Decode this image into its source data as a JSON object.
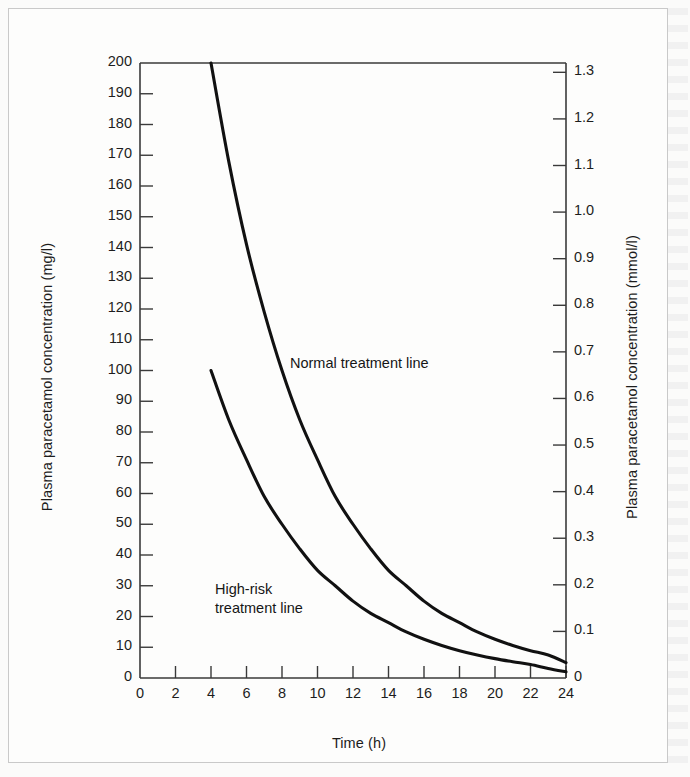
{
  "figure": {
    "background_color": "#fdfdfc",
    "frame_color": "#c9c9c9",
    "curve_color": "#111111",
    "axis_color": "#3a3a3a"
  },
  "chart_data": {
    "type": "line",
    "title": "",
    "xlabel": "Time (h)",
    "ylabel": "Plasma paracetamol concentration (mg/l)",
    "ylabel_right": "Plasma paracetamol concentration (mmol/l)",
    "xlim": [
      0,
      24
    ],
    "ylim": [
      0,
      200
    ],
    "ylim_right": [
      0,
      1.32
    ],
    "grid": false,
    "legend": "inline annotations",
    "xticks": [
      0,
      2,
      4,
      6,
      8,
      10,
      12,
      14,
      16,
      18,
      20,
      22,
      24
    ],
    "xtick_labels": [
      "0",
      "2",
      "4",
      "6",
      "8",
      "10",
      "12",
      "14",
      "16",
      "18",
      "20",
      "22",
      "24"
    ],
    "yticks": [
      0,
      10,
      20,
      30,
      40,
      50,
      60,
      70,
      80,
      90,
      100,
      110,
      120,
      130,
      140,
      150,
      160,
      170,
      180,
      190,
      200
    ],
    "ytick_labels": [
      "0",
      "10",
      "20",
      "30",
      "40",
      "50",
      "60",
      "70",
      "80",
      "90",
      "100",
      "110",
      "120",
      "130",
      "140",
      "150",
      "160",
      "170",
      "180",
      "190",
      "200"
    ],
    "yticks_right": [
      0,
      0.1,
      0.2,
      0.3,
      0.4,
      0.5,
      0.6,
      0.7,
      0.8,
      0.9,
      1.0,
      1.1,
      1.2,
      1.3
    ],
    "ytick_labels_right": [
      "0",
      "0.1",
      "0.2",
      "0.3",
      "0.4",
      "0.5",
      "0.6",
      "0.7",
      "0.8",
      "0.9",
      "1.0",
      "1.1",
      "1.2",
      "1.3"
    ],
    "x": [
      4,
      5,
      6,
      7,
      8,
      9,
      10,
      11,
      12,
      13,
      14,
      15,
      16,
      17,
      18,
      19,
      20,
      21,
      22,
      23,
      24
    ],
    "series": [
      {
        "name": "Normal treatment line",
        "annotation": "Normal treatment line",
        "values": [
          200,
          168,
          141,
          119,
          100,
          84,
          71,
          59,
          50,
          42,
          35,
          30,
          25,
          21,
          18,
          15,
          12.6,
          10.6,
          8.9,
          7.5,
          5.0
        ]
      },
      {
        "name": "High-risk treatment line",
        "annotation": "High-risk\ntreatment line",
        "values": [
          100,
          84,
          71,
          59,
          50,
          42,
          35,
          30,
          25,
          21,
          18,
          15,
          12.6,
          10.6,
          8.9,
          7.5,
          6.3,
          5.3,
          4.4,
          3.1,
          2.0
        ]
      }
    ]
  }
}
